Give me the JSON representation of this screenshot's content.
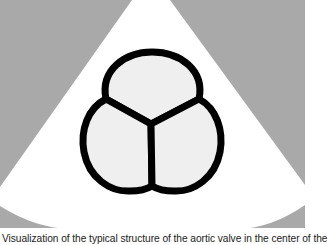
{
  "figure": {
    "colors": {
      "background_gray": "#a9a9a9",
      "sector_white": "#ffffff",
      "cusp_fill": "#efefef",
      "outline": "#000000"
    },
    "cusps": [
      {
        "name": "top-cusp"
      },
      {
        "name": "left-cusp"
      },
      {
        "name": "right-cusp"
      }
    ]
  },
  "caption": {
    "text": "Visualization of the typical structure of the aortic valve in the center of the"
  }
}
